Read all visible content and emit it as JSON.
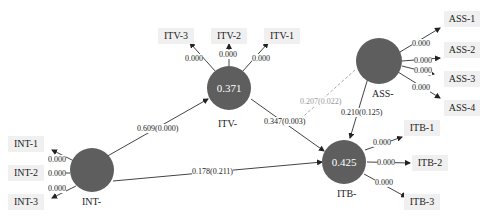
{
  "latent": {
    "INT": {
      "name": "INT-",
      "r2": ""
    },
    "ITV": {
      "name": "ITV-",
      "r2": "0.371"
    },
    "ITB": {
      "name": "ITB-",
      "r2": "0.425"
    },
    "ASS": {
      "name": "ASS-",
      "r2": ""
    }
  },
  "indicators": {
    "INT": [
      "INT-1",
      "INT-2",
      "INT-3"
    ],
    "ITV": [
      "ITV-3",
      "ITV-2",
      "ITV-1"
    ],
    "ASS": [
      "ASS-1",
      "ASS-2",
      "ASS-3",
      "ASS-4"
    ],
    "ITB": [
      "ITB-1",
      "ITB-2",
      "ITB-3"
    ]
  },
  "loadings": {
    "INT": [
      "0.000",
      "0.000",
      "0.000"
    ],
    "ITV": [
      "0.000",
      "0.000",
      "0.000"
    ],
    "ASS": [
      "0.000",
      "0.000",
      "0.000",
      "0.000"
    ],
    "ITB": [
      "0.000",
      "0.000",
      "0.000"
    ]
  },
  "paths": {
    "INT_ITV": "0.609(0.000)",
    "INT_ITB": "0.178(0.211)",
    "ITV_ITB": "0.347(0.003)",
    "ASS_ITB": "0.210(0.125)",
    "ASS_ITV_dashed": "0.207(0.022)"
  },
  "colors": {
    "node": "#5e5e5e",
    "indicator_bg": "#f0f0f0",
    "dashed": "#aaaaaa"
  }
}
